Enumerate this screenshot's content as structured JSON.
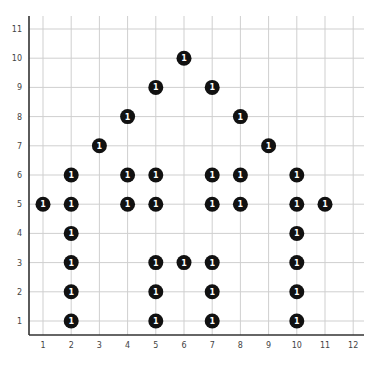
{
  "chart_data": {
    "type": "scatter",
    "title": "",
    "xlabel": "",
    "ylabel": "",
    "xlim": [
      0.5,
      12.3
    ],
    "ylim": [
      0.5,
      11.4
    ],
    "grid": true,
    "legend": null,
    "x_ticks": [
      1,
      2,
      3,
      4,
      5,
      6,
      7,
      8,
      9,
      10,
      11,
      12
    ],
    "y_ticks": [
      1,
      2,
      3,
      4,
      5,
      6,
      7,
      8,
      9,
      10,
      11
    ],
    "marker_label": "1",
    "marker_color": "#111111",
    "marker_text_color": "#ffffff",
    "points": [
      {
        "x": 6,
        "y": 10,
        "label": "1"
      },
      {
        "x": 5,
        "y": 9,
        "label": "1"
      },
      {
        "x": 7,
        "y": 9,
        "label": "1"
      },
      {
        "x": 4,
        "y": 8,
        "label": "1"
      },
      {
        "x": 8,
        "y": 8,
        "label": "1"
      },
      {
        "x": 3,
        "y": 7,
        "label": "1"
      },
      {
        "x": 9,
        "y": 7,
        "label": "1"
      },
      {
        "x": 2,
        "y": 6,
        "label": "1"
      },
      {
        "x": 4,
        "y": 6,
        "label": "1"
      },
      {
        "x": 5,
        "y": 6,
        "label": "1"
      },
      {
        "x": 7,
        "y": 6,
        "label": "1"
      },
      {
        "x": 8,
        "y": 6,
        "label": "1"
      },
      {
        "x": 10,
        "y": 6,
        "label": "1"
      },
      {
        "x": 1,
        "y": 5,
        "label": "1"
      },
      {
        "x": 2,
        "y": 5,
        "label": "1"
      },
      {
        "x": 4,
        "y": 5,
        "label": "1"
      },
      {
        "x": 5,
        "y": 5,
        "label": "1"
      },
      {
        "x": 7,
        "y": 5,
        "label": "1"
      },
      {
        "x": 8,
        "y": 5,
        "label": "1"
      },
      {
        "x": 10,
        "y": 5,
        "label": "1"
      },
      {
        "x": 11,
        "y": 5,
        "label": "1"
      },
      {
        "x": 2,
        "y": 4,
        "label": "1"
      },
      {
        "x": 10,
        "y": 4,
        "label": "1"
      },
      {
        "x": 2,
        "y": 3,
        "label": "1"
      },
      {
        "x": 5,
        "y": 3,
        "label": "1"
      },
      {
        "x": 6,
        "y": 3,
        "label": "1"
      },
      {
        "x": 7,
        "y": 3,
        "label": "1"
      },
      {
        "x": 10,
        "y": 3,
        "label": "1"
      },
      {
        "x": 2,
        "y": 2,
        "label": "1"
      },
      {
        "x": 5,
        "y": 2,
        "label": "1"
      },
      {
        "x": 7,
        "y": 2,
        "label": "1"
      },
      {
        "x": 10,
        "y": 2,
        "label": "1"
      },
      {
        "x": 2,
        "y": 1,
        "label": "1"
      },
      {
        "x": 5,
        "y": 1,
        "label": "1"
      },
      {
        "x": 7,
        "y": 1,
        "label": "1"
      },
      {
        "x": 10,
        "y": 1,
        "label": "1"
      }
    ]
  }
}
